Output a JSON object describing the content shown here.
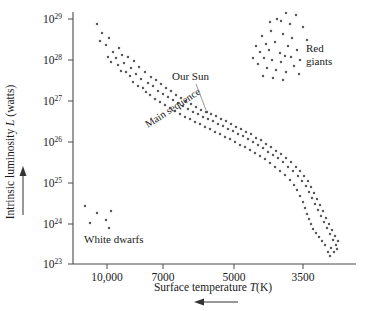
{
  "chart_data": {
    "type": "scatter",
    "title": "",
    "xlabel": "Surface temperature T(K)",
    "ylabel": "Intrinsic luminosity L (watts)",
    "xlabel_parts": {
      "prefix": "Surface temperature ",
      "italic": "T",
      "suffix": "(K)"
    },
    "ylabel_parts": {
      "prefix": "Intrinsic luminosity ",
      "italic": "L",
      "suffix": " (watts)"
    },
    "x_axis": {
      "scale": "log-reversed",
      "direction": "decreasing-right",
      "tick_labels": [
        "10,000",
        "7000",
        "5000",
        "3500"
      ],
      "tick_values": [
        10000,
        7000,
        5000,
        3500
      ],
      "tick_px": [
        107,
        163,
        234,
        303
      ],
      "arrow_direction": "left",
      "range_px": [
        73,
        355
      ]
    },
    "y_axis": {
      "scale": "log",
      "tick_labels": [
        "10^29",
        "10^28",
        "10^27",
        "10^26",
        "10^25",
        "10^24",
        "10^23"
      ],
      "tick_mantissa": "10",
      "tick_exponents": [
        "29",
        "28",
        "27",
        "26",
        "25",
        "24",
        "23"
      ],
      "tick_px": [
        19,
        60,
        101,
        142,
        183,
        224,
        264
      ],
      "arrow_direction": "up",
      "range_px": [
        19,
        264
      ],
      "units": "watts"
    },
    "grid": false,
    "legend": "none",
    "annotations": [
      {
        "id": "red-giants",
        "text": "Red giants",
        "lines": [
          "Red",
          "giants"
        ],
        "x": 306,
        "y": 52
      },
      {
        "id": "our-sun",
        "text": "Our Sun",
        "x": 172,
        "y": 80,
        "leader_from": [
          196,
          84
        ],
        "leader_to": [
          206,
          110
        ]
      },
      {
        "id": "main-sequence",
        "text": "Main sequence",
        "x": 148,
        "y": 128,
        "rotation": -33
      },
      {
        "id": "white-dwarfs",
        "text": "White dwarfs",
        "x": 84,
        "y": 243
      }
    ],
    "series": [
      {
        "name": "Main sequence",
        "marker": "dot",
        "color": "#5a5a5a",
        "points_px": [
          [
            97,
            24
          ],
          [
            102,
            33
          ],
          [
            100,
            41
          ],
          [
            106,
            45
          ],
          [
            109,
            38
          ],
          [
            113,
            52
          ],
          [
            108,
            57
          ],
          [
            116,
            58
          ],
          [
            111,
            62
          ],
          [
            119,
            48
          ],
          [
            122,
            55
          ],
          [
            118,
            65
          ],
          [
            124,
            63
          ],
          [
            128,
            57
          ],
          [
            121,
            71
          ],
          [
            126,
            72
          ],
          [
            131,
            68
          ],
          [
            134,
            61
          ],
          [
            130,
            76
          ],
          [
            136,
            74
          ],
          [
            139,
            67
          ],
          [
            133,
            82
          ],
          [
            141,
            79
          ],
          [
            145,
            72
          ],
          [
            138,
            86
          ],
          [
            143,
            88
          ],
          [
            148,
            83
          ],
          [
            151,
            77
          ],
          [
            146,
            92
          ],
          [
            153,
            86
          ],
          [
            156,
            80
          ],
          [
            150,
            95
          ],
          [
            158,
            91
          ],
          [
            161,
            84
          ],
          [
            155,
            99
          ],
          [
            163,
            94
          ],
          [
            166,
            88
          ],
          [
            160,
            102
          ],
          [
            168,
            97
          ],
          [
            171,
            91
          ],
          [
            165,
            105
          ],
          [
            173,
            100
          ],
          [
            176,
            95
          ],
          [
            170,
            108
          ],
          [
            178,
            103
          ],
          [
            181,
            98
          ],
          [
            175,
            111
          ],
          [
            183,
            106
          ],
          [
            186,
            101
          ],
          [
            180,
            114
          ],
          [
            188,
            109
          ],
          [
            191,
            104
          ],
          [
            185,
            117
          ],
          [
            193,
            112
          ],
          [
            196,
            107
          ],
          [
            190,
            119
          ],
          [
            198,
            114
          ],
          [
            201,
            110
          ],
          [
            195,
            122
          ],
          [
            203,
            117
          ],
          [
            206,
            112
          ],
          [
            200,
            124
          ],
          [
            208,
            119
          ],
          [
            211,
            114
          ],
          [
            205,
            127
          ],
          [
            213,
            121
          ],
          [
            216,
            116
          ],
          [
            210,
            129
          ],
          [
            218,
            124
          ],
          [
            221,
            119
          ],
          [
            215,
            132
          ],
          [
            223,
            126
          ],
          [
            226,
            121
          ],
          [
            220,
            134
          ],
          [
            228,
            129
          ],
          [
            231,
            124
          ],
          [
            225,
            137
          ],
          [
            233,
            131
          ],
          [
            236,
            127
          ],
          [
            230,
            139
          ],
          [
            238,
            134
          ],
          [
            241,
            129
          ],
          [
            235,
            142
          ],
          [
            243,
            136
          ],
          [
            246,
            132
          ],
          [
            240,
            145
          ],
          [
            248,
            139
          ],
          [
            251,
            134
          ],
          [
            245,
            147
          ],
          [
            253,
            142
          ],
          [
            256,
            138
          ],
          [
            250,
            150
          ],
          [
            258,
            145
          ],
          [
            261,
            140
          ],
          [
            255,
            153
          ],
          [
            263,
            148
          ],
          [
            266,
            144
          ],
          [
            260,
            156
          ],
          [
            268,
            152
          ],
          [
            271,
            147
          ],
          [
            265,
            159
          ],
          [
            273,
            155
          ],
          [
            276,
            151
          ],
          [
            270,
            163
          ],
          [
            278,
            158
          ],
          [
            281,
            154
          ],
          [
            275,
            167
          ],
          [
            283,
            162
          ],
          [
            286,
            158
          ],
          [
            280,
            171
          ],
          [
            288,
            167
          ],
          [
            291,
            162
          ],
          [
            285,
            175
          ],
          [
            293,
            171
          ],
          [
            296,
            167
          ],
          [
            290,
            180
          ],
          [
            298,
            176
          ],
          [
            300,
            171
          ],
          [
            294,
            185
          ],
          [
            302,
            181
          ],
          [
            304,
            176
          ],
          [
            297,
            190
          ],
          [
            306,
            186
          ],
          [
            308,
            181
          ],
          [
            300,
            196
          ],
          [
            309,
            192
          ],
          [
            311,
            187
          ],
          [
            303,
            202
          ],
          [
            312,
            198
          ],
          [
            314,
            193
          ],
          [
            305,
            208
          ],
          [
            315,
            204
          ],
          [
            317,
            199
          ],
          [
            307,
            214
          ],
          [
            318,
            210
          ],
          [
            320,
            205
          ],
          [
            309,
            219
          ],
          [
            321,
            216
          ],
          [
            323,
            211
          ],
          [
            311,
            224
          ],
          [
            324,
            222
          ],
          [
            326,
            218
          ],
          [
            313,
            229
          ],
          [
            327,
            228
          ],
          [
            329,
            224
          ],
          [
            316,
            233
          ],
          [
            330,
            234
          ],
          [
            332,
            230
          ],
          [
            319,
            237
          ],
          [
            333,
            240
          ],
          [
            335,
            236
          ],
          [
            322,
            241
          ],
          [
            336,
            245
          ],
          [
            331,
            248
          ],
          [
            338,
            241
          ],
          [
            325,
            245
          ],
          [
            334,
            252
          ],
          [
            328,
            252
          ],
          [
            337,
            249
          ],
          [
            330,
            256
          ]
        ]
      },
      {
        "name": "Red giants",
        "marker": "dot",
        "color": "#5a5a5a",
        "points_px": [
          [
            286,
            13
          ],
          [
            296,
            15
          ],
          [
            303,
            27
          ],
          [
            277,
            19
          ],
          [
            262,
            36
          ],
          [
            271,
            31
          ],
          [
            283,
            34
          ],
          [
            292,
            38
          ],
          [
            266,
            44
          ],
          [
            275,
            42
          ],
          [
            288,
            46
          ],
          [
            297,
            50
          ],
          [
            260,
            52
          ],
          [
            269,
            50
          ],
          [
            280,
            53
          ],
          [
            285,
            56
          ],
          [
            264,
            58
          ],
          [
            272,
            60
          ],
          [
            281,
            62
          ],
          [
            291,
            57
          ],
          [
            267,
            68
          ],
          [
            276,
            70
          ],
          [
            286,
            72
          ],
          [
            258,
            64
          ],
          [
            294,
            66
          ],
          [
            273,
            78
          ],
          [
            283,
            80
          ],
          [
            263,
            76
          ],
          [
            300,
            60
          ],
          [
            256,
            46
          ],
          [
            290,
            24
          ],
          [
            307,
            40
          ],
          [
            253,
            58
          ],
          [
            299,
            74
          ],
          [
            270,
            22
          ],
          [
            281,
            21
          ]
        ]
      },
      {
        "name": "White dwarfs",
        "marker": "dot",
        "color": "#5a5a5a",
        "points_px": [
          [
            85,
            206
          ],
          [
            97,
            213
          ],
          [
            111,
            211
          ],
          [
            106,
            220
          ],
          [
            109,
            228
          ],
          [
            90,
            223
          ]
        ]
      },
      {
        "name": "Our Sun",
        "marker": "dot",
        "color": "#5a5a5a",
        "points_px": [
          [
            207,
            112
          ]
        ]
      }
    ]
  }
}
